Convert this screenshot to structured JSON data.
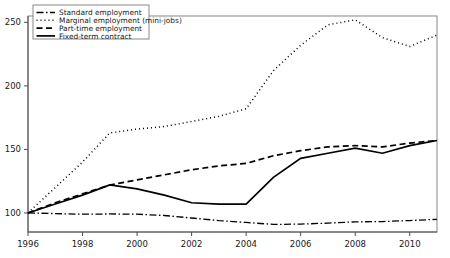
{
  "chart_data": {
    "type": "line",
    "title": "",
    "subtitle": "",
    "xlabel": "",
    "ylabel": "",
    "xlim": [
      1996,
      2011
    ],
    "ylim": [
      85,
      255
    ],
    "grid": false,
    "legend_position": "top-left",
    "x": [
      1996,
      1997,
      1998,
      1999,
      2000,
      2001,
      2002,
      2003,
      2004,
      2005,
      2006,
      2007,
      2008,
      2009,
      2010,
      2011
    ],
    "xticks": [
      1996,
      1998,
      2000,
      2002,
      2004,
      2006,
      2008,
      2010
    ],
    "xtick_labels": [
      "1996",
      "1998",
      "2000",
      "2002",
      "2004",
      "2006",
      "2008",
      "2010"
    ],
    "yticks": [
      100,
      150,
      200,
      250
    ],
    "ytick_labels": [
      "100",
      "150",
      "200",
      "250"
    ],
    "series": [
      {
        "name": "Standard employment",
        "linestyle": "dashdot",
        "color": "#000000",
        "values": [
          100,
          99.5,
          99.0,
          99.2,
          99.0,
          98.0,
          96.0,
          94.0,
          92.5,
          91.0,
          91.2,
          92.0,
          93.0,
          93.2,
          94.0,
          95.0
        ]
      },
      {
        "name": "Marginal employment (mini-jobs)",
        "linestyle": "dotted",
        "color": "#000000",
        "values": [
          100,
          120,
          140,
          163,
          166,
          168,
          172,
          176,
          182,
          212,
          232,
          248,
          252,
          238,
          231,
          240
        ]
      },
      {
        "name": "Part-time employment",
        "linestyle": "dashed",
        "color": "#000000",
        "values": [
          100,
          108,
          115,
          122,
          126,
          130,
          134,
          137,
          139,
          145,
          149,
          152,
          153,
          152,
          155,
          157
        ]
      },
      {
        "name": "Fixed-term contract",
        "linestyle": "solid",
        "color": "#000000",
        "values": [
          100,
          107,
          114,
          122,
          119,
          114,
          108,
          107,
          107,
          128,
          143,
          147,
          151,
          147,
          153,
          157
        ]
      }
    ]
  },
  "legend": {
    "entries": [
      {
        "label": "Standard employment",
        "marker": "dashdot"
      },
      {
        "label": "Marginal employment (mini-jobs)",
        "marker": "dotted"
      },
      {
        "label": "Part-time employment",
        "marker": "dashed"
      },
      {
        "label": "Fixed-term contract",
        "marker": "solid"
      }
    ]
  }
}
